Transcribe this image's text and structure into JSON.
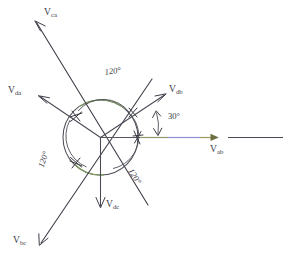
{
  "figure": {
    "type": "phasor-diagram",
    "canvas": {
      "width": 299,
      "height": 265,
      "background": "#ffffff"
    },
    "origin": {
      "x": 100.5,
      "y": 137.5
    },
    "circle": {
      "cx": 100.5,
      "cy": 137.5,
      "r": 37.5
    },
    "colors": {
      "line": "#4a4a55",
      "circle": "#4f4f59",
      "circle_highlight": "#7f9b5e",
      "axis_olive": "#8f9a6a",
      "axis_violet": "#8e8fcf",
      "text": "#3b3b46"
    }
  },
  "phasors": [
    {
      "name": "V_ca",
      "label": "V",
      "subscript": "ca",
      "angle_deg": 120,
      "kind": "long-diagonal",
      "tip": {
        "x": 34,
        "y": 20
      },
      "label_pos": {
        "x": 44,
        "y": 10
      }
    },
    {
      "name": "V_da",
      "label": "V",
      "subscript": "da",
      "angle_deg": 150,
      "kind": "short-radial",
      "tip": {
        "x": 38,
        "y": 96
      },
      "label_pos": {
        "x": 9,
        "y": 87
      }
    },
    {
      "name": "V_db",
      "label": "V",
      "subscript": "db",
      "angle_deg": 30,
      "kind": "short-radial",
      "tip": {
        "x": 166,
        "y": 94
      },
      "label_pos": {
        "x": 168,
        "y": 88
      }
    },
    {
      "name": "V_ab",
      "label": "V",
      "subscript": "ab",
      "angle_deg": 0,
      "kind": "horizontal-reference",
      "tip": {
        "x": 218,
        "y": 137.5
      },
      "label_pos": {
        "x": 209,
        "y": 145
      }
    },
    {
      "name": "V_dc",
      "label": "V",
      "subscript": "dc",
      "angle_deg": 270,
      "kind": "short-radial",
      "tip": {
        "x": 100.5,
        "y": 208
      },
      "label_pos": {
        "x": 105,
        "y": 200
      }
    },
    {
      "name": "V_bc",
      "label": "V",
      "subscript": "bc",
      "angle_deg": 240,
      "kind": "long-diagonal",
      "tip": {
        "x": 39,
        "y": 245
      },
      "label_pos": {
        "x": 14,
        "y": 236
      }
    }
  ],
  "angle_annotations": [
    {
      "name": "angle-120-top",
      "text": "120°",
      "value": 120,
      "unit": "deg",
      "between": [
        "V_da",
        "V_db"
      ],
      "pos": {
        "x": 107,
        "y": 70
      },
      "rotation_deg": -8
    },
    {
      "name": "angle-120-left",
      "text": "120°",
      "value": 120,
      "unit": "deg",
      "between": [
        "V_da",
        "V_dc"
      ],
      "pos": {
        "x": 47,
        "y": 146
      },
      "rotation_deg": -72
    },
    {
      "name": "angle-120-lower-right",
      "text": "120°",
      "value": 120,
      "unit": "deg",
      "between": [
        "V_dc",
        "V_db"
      ],
      "pos": {
        "x": 136,
        "y": 170
      },
      "rotation_deg": 58
    },
    {
      "name": "angle-30",
      "text": "30°",
      "value": 30,
      "unit": "deg",
      "between": [
        "V_ab",
        "V_db"
      ],
      "pos": {
        "x": 168,
        "y": 114
      },
      "rotation_deg": 0
    }
  ],
  "detached_segment": {
    "name": "reference-line-segment",
    "x1": 228,
    "y1": 137.5,
    "x2": 283,
    "y2": 137.5
  },
  "intersection_ticks": [
    {
      "name": "tick-upper-left",
      "x": 76,
      "y": 116
    },
    {
      "name": "tick-lower-left",
      "x": 76,
      "y": 163
    },
    {
      "name": "tick-right-axis",
      "x": 139,
      "y": 137.5
    },
    {
      "name": "tick-db-arc",
      "x": 133,
      "y": 112
    }
  ]
}
